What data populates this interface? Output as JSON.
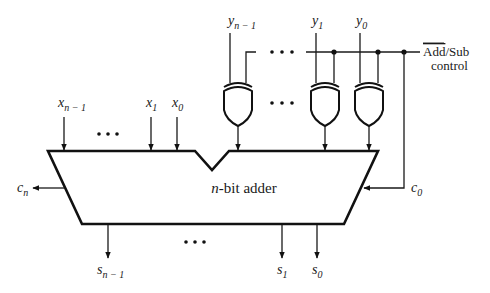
{
  "diagram": {
    "adder_label": "n-bit adder",
    "inputs_x": [
      {
        "base": "x",
        "sub": "n − 1"
      },
      {
        "base": "x",
        "sub": "1"
      },
      {
        "base": "x",
        "sub": "0"
      }
    ],
    "inputs_y": [
      {
        "base": "y",
        "sub": "n − 1"
      },
      {
        "base": "y",
        "sub": "1"
      },
      {
        "base": "y",
        "sub": "0"
      }
    ],
    "outputs_s": [
      {
        "base": "s",
        "sub": "n − 1"
      },
      {
        "base": "s",
        "sub": "1"
      },
      {
        "base": "s",
        "sub": "0"
      }
    ],
    "carry_out": {
      "base": "c",
      "sub": "n"
    },
    "carry_in": {
      "base": "c",
      "sub": "0"
    },
    "control": {
      "overline_text": "Add",
      "separator": "/",
      "text": "Sub",
      "line2": "control"
    },
    "gate_type": "XOR",
    "ellipsis": "• • •",
    "colors": {
      "stroke": "#111111",
      "background": "#ffffff"
    }
  }
}
